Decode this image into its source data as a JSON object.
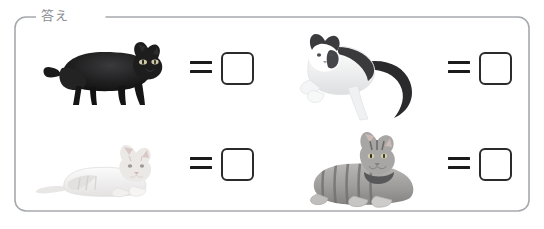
{
  "panel": {
    "legend": "答え",
    "border_color": "#a6a9ad",
    "legend_color": "#8a8d92",
    "background": "#ffffff"
  },
  "symbols": {
    "equals": "=",
    "equals_color": "#1b1b1b",
    "answer_box_border_color": "#2b2b2b",
    "answer_box_fill": "#ffffff"
  },
  "problems": [
    {
      "id": "problem-1",
      "position": "top-left",
      "subject": "black-cat-photo",
      "subject_description": "black cat standing/stretching in profile",
      "equals": "=",
      "answer_value": "",
      "answer_placeholder": ""
    },
    {
      "id": "problem-2",
      "position": "top-right",
      "subject": "tuxedo-cat-photo",
      "subject_description": "black and white tuxedo cat lying with long tail",
      "equals": "=",
      "answer_value": "",
      "answer_placeholder": ""
    },
    {
      "id": "problem-3",
      "position": "bottom-left",
      "subject": "cream-cat-photo",
      "subject_description": "pale cream coloured cat lying down",
      "equals": "=",
      "answer_value": "",
      "answer_placeholder": ""
    },
    {
      "id": "problem-4",
      "position": "bottom-right",
      "subject": "tabby-cat-photo",
      "subject_description": "grey tabby cat with collar lying down",
      "equals": "=",
      "answer_value": "",
      "answer_placeholder": ""
    }
  ]
}
